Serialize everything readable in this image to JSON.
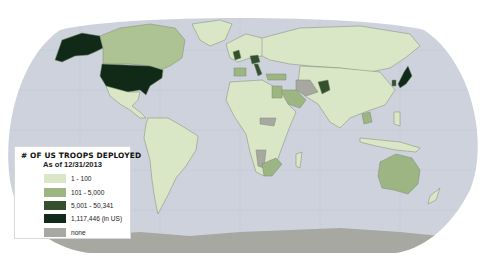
{
  "map": {
    "projection": "Robinson-style world map",
    "ocean_color": "#cdd2dc",
    "graticule_color": "#bfc5d1",
    "background": "#ffffff",
    "border_color": "#7c8a72"
  },
  "legend": {
    "title": "# OF US TROOPS DEPLOYED",
    "subtitle": "As of 12/31/2013",
    "items": [
      {
        "label": "1 - 100",
        "color": "#d9e7c6"
      },
      {
        "label": "101 - 5,000",
        "color": "#9db583"
      },
      {
        "label": "5,001 - 50,341",
        "color": "#34502c"
      },
      {
        "label": "1,117,446 (in US)",
        "color": "#102a17"
      },
      {
        "label": "none",
        "color": "#a8a8a2"
      }
    ]
  },
  "highlighted_countries": {
    "in_us_1117446": [
      "United States",
      "Alaska"
    ],
    "5001_50341": [
      "Germany",
      "Italy",
      "United Kingdom",
      "Japan",
      "South Korea",
      "Afghanistan"
    ],
    "101_5000": [
      "Canada",
      "Spain",
      "Egypt",
      "Saudi Arabia",
      "Kuwait",
      "Bahrain",
      "Qatar",
      "UAE",
      "Djibouti",
      "South Africa",
      "Australia",
      "Thailand",
      "Turkey"
    ],
    "none": [
      "Iran",
      "Namibia",
      "Central African Republic",
      "Chad (part)",
      "Antarctica",
      "Greenland (part)"
    ],
    "1_100": [
      "most other countries"
    ]
  }
}
